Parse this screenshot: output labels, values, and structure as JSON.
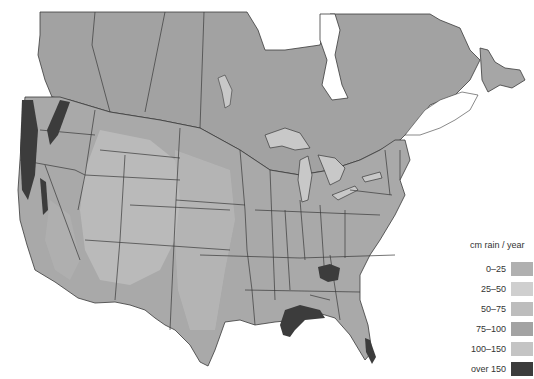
{
  "map": {
    "region": "North America (United States and southern Canada)",
    "theme": "Annual precipitation",
    "colors": {
      "land_base": "#a9a9a9",
      "canada": "#a2a2a2",
      "water": "#ffffff",
      "lakes": "#c8c8c8",
      "border": "#3a3a3a"
    }
  },
  "legend": {
    "title": "cm rain / year",
    "items": [
      {
        "label": "0–25",
        "color": "#b0b0b0"
      },
      {
        "label": "25–50",
        "color": "#cfcfcf"
      },
      {
        "label": "50–75",
        "color": "#bdbdbd"
      },
      {
        "label": "75–100",
        "color": "#a3a3a3"
      },
      {
        "label": "100–150",
        "color": "#c4c4c4"
      },
      {
        "label": "over 150",
        "color": "#3c3c3c"
      }
    ]
  }
}
